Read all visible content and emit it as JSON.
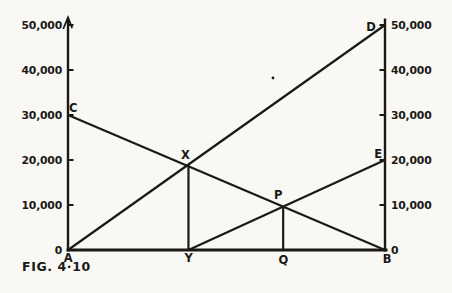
{
  "figure": {
    "caption": "FIG. 4·10",
    "background_color": "#f9f8f4",
    "ink_color": "#1b1916"
  },
  "chart_data": {
    "type": "line",
    "title": "",
    "caption": "FIG. 4·10",
    "y_axis": {
      "min": 0,
      "max": 50000,
      "tick_step": 10000,
      "tick_values": [
        50000,
        40000,
        30000,
        20000,
        10000,
        0
      ],
      "left_tick_labels": [
        "50,000",
        "40,000",
        "30,000",
        "20,000",
        "10,000",
        "0"
      ],
      "right_tick_labels": [
        "50,000",
        "40,000",
        "30,000",
        "20,000",
        "10,000",
        "0"
      ]
    },
    "x_axis": {
      "baseline_point_labels": [
        "A",
        "Y",
        "Q",
        "B"
      ]
    },
    "points": {
      "A": {
        "u": 0.0,
        "v": 0,
        "label": "A"
      },
      "B": {
        "u": 1.0,
        "v": 0,
        "label": "B"
      },
      "C": {
        "u": 0.0,
        "v": 30000,
        "label": "C"
      },
      "D": {
        "u": 1.0,
        "v": 50000,
        "label": "D"
      },
      "E": {
        "u": 1.0,
        "v": 20000,
        "label": "E"
      },
      "X": {
        "u": 0.38,
        "v": 19000,
        "label": "X"
      },
      "Y": {
        "u": 0.38,
        "v": 0,
        "label": "Y"
      },
      "P": {
        "u": 0.6788,
        "v": 9636,
        "label": "P"
      },
      "Q": {
        "u": 0.6788,
        "v": 0,
        "label": "Q"
      }
    },
    "lines": [
      {
        "name": "line-AD",
        "from": "A",
        "to": "D"
      },
      {
        "name": "line-CB",
        "from": "C",
        "to": "B"
      },
      {
        "name": "line-YE",
        "from": "Y",
        "to": "E"
      },
      {
        "name": "ordinate-XY",
        "from": "X",
        "to": "Y"
      },
      {
        "name": "ordinate-PQ",
        "from": "P",
        "to": "Q"
      }
    ]
  }
}
